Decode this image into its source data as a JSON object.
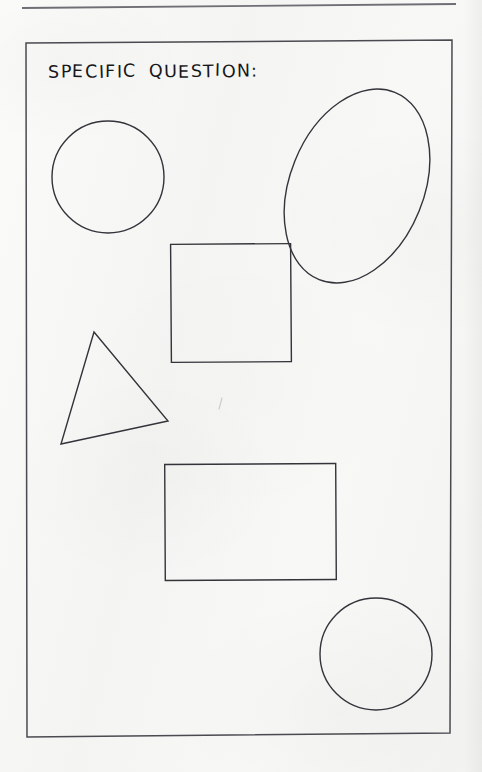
{
  "page": {
    "width": 482,
    "height": 772,
    "background_color": "#f7f7f6",
    "ink_color": "#33333a",
    "title_color": "#17171a"
  },
  "header_rule": {
    "name": "top-horizontal-rule",
    "x1": 22,
    "y1": 8,
    "x2": 456,
    "y2": 4,
    "stroke_width": 1.8,
    "color": "#6e6e74"
  },
  "worksheet": {
    "title": "SPECIFIC QUESTION:",
    "frame": {
      "name": "worksheet-border",
      "points": "26,43 452,40 450,733 27,737",
      "stroke_width": 1.5,
      "color": "#4a4a50"
    }
  },
  "shapes": [
    {
      "id": "circle-top-left",
      "label": "circle",
      "type": "circle",
      "cx": 108,
      "cy": 177,
      "r": 56,
      "rotation": 0,
      "stroke_width": 1.4
    },
    {
      "id": "ellipse-top-right",
      "label": "ellipse",
      "type": "ellipse",
      "cx": 357,
      "cy": 186,
      "rx": 67,
      "ry": 101,
      "rotation": 22,
      "stroke_width": 1.4
    },
    {
      "id": "square-middle",
      "label": "square",
      "type": "rect",
      "x": 171,
      "y": 244,
      "width": 120,
      "height": 118,
      "rotation": -0.4,
      "stroke_width": 1.4
    },
    {
      "id": "triangle-left",
      "label": "triangle",
      "type": "polygon",
      "points": "94,332 168,421 61,444",
      "rotation": 0,
      "stroke_width": 1.4
    },
    {
      "id": "rectangle-lower",
      "label": "rectangle",
      "type": "rect",
      "x": 165,
      "y": 464,
      "width": 171,
      "height": 116,
      "rotation": -0.3,
      "stroke_width": 1.4
    },
    {
      "id": "circle-bottom-right",
      "label": "circle",
      "type": "circle",
      "cx": 376,
      "cy": 654,
      "r": 56,
      "rotation": 0,
      "stroke_width": 1.4
    }
  ],
  "stray_mark": {
    "name": "faint-pencil-tick",
    "x": 221,
    "y": 399,
    "length": 11,
    "color": "#c9c9cd"
  }
}
